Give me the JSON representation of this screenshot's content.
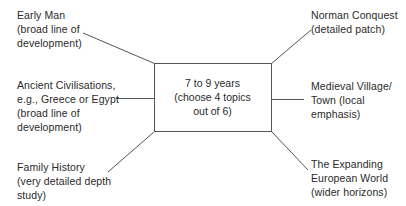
{
  "diagram": {
    "center": {
      "lines": [
        "7 to 9 years",
        "(choose 4 topics",
        "out of 6)"
      ]
    },
    "topics": [
      {
        "id": "early-man",
        "lines": [
          "Early Man",
          "(broad line of",
          "development)"
        ],
        "side": "left"
      },
      {
        "id": "ancient-civilisations",
        "lines": [
          "Ancient Civilisations,",
          "e.g., Greece or Egypt",
          "(broad line of",
          "development)"
        ],
        "side": "left"
      },
      {
        "id": "family-history",
        "lines": [
          "Family History",
          "(very detailed depth",
          "study)"
        ],
        "side": "left"
      },
      {
        "id": "norman-conquest",
        "lines": [
          "Norman Conquest",
          "(detailed patch)"
        ],
        "side": "right"
      },
      {
        "id": "medieval-village",
        "lines": [
          "Medieval Village/",
          "Town (local",
          "emphasis)"
        ],
        "side": "right"
      },
      {
        "id": "expanding-european-world",
        "lines": [
          "The Expanding",
          "European World",
          "(wider horizons)"
        ],
        "side": "right"
      }
    ],
    "colors": {
      "line": "#555555",
      "text": "#2a2a2a",
      "background": "#ffffff"
    }
  }
}
